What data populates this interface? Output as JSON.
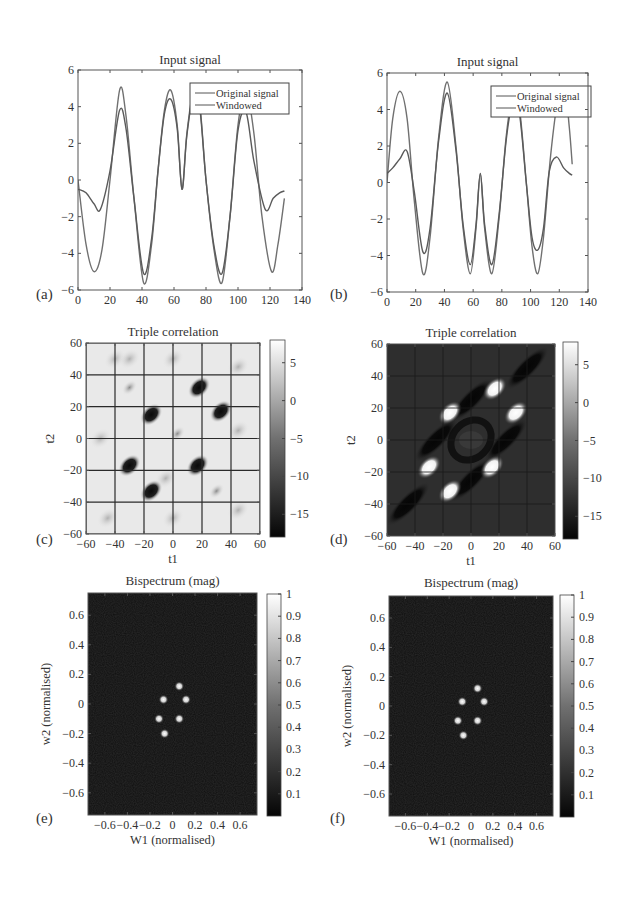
{
  "figure": {
    "panels": [
      "(a)",
      "(b)",
      "(c)",
      "(d)",
      "(e)",
      "(f)"
    ]
  },
  "chart_data": [
    {
      "panel": "(a)",
      "type": "line",
      "title": "Input signal",
      "xlabel": "",
      "ylabel": "",
      "xlim": [
        0,
        140
      ],
      "ylim": [
        -6,
        6
      ],
      "xticks": [
        0,
        20,
        40,
        60,
        80,
        100,
        120,
        140
      ],
      "yticks": [
        -6,
        -4,
        -2,
        0,
        2,
        4,
        6
      ],
      "legend": [
        "Original signal",
        "Windowed"
      ],
      "legend_position": "upper right",
      "series": [
        {
          "name": "Original signal",
          "x": [
            0,
            5,
            10,
            15,
            20,
            26,
            30,
            35,
            41,
            46,
            50,
            54,
            58,
            62,
            65,
            68,
            72,
            76,
            80,
            85,
            90,
            95,
            100,
            105,
            110,
            115,
            121,
            125,
            129
          ],
          "y": [
            0,
            -3.5,
            -5,
            -3.8,
            0,
            4.9,
            3.5,
            -1,
            -5.6,
            -3.5,
            0.5,
            3.8,
            4.9,
            3,
            -0.5,
            2.5,
            4.8,
            4.2,
            0,
            -3.8,
            -5.6,
            -2,
            3,
            4.9,
            2.5,
            -2,
            -5,
            -3.5,
            -1
          ]
        },
        {
          "name": "Windowed",
          "x": [
            0,
            5,
            10,
            14,
            20,
            26,
            30,
            35,
            41,
            46,
            50,
            54,
            58,
            62,
            65,
            68,
            72,
            76,
            80,
            85,
            90,
            95,
            100,
            105,
            110,
            117,
            122,
            126,
            129
          ],
          "y": [
            -0.5,
            -0.7,
            -1.3,
            -1.6,
            0.5,
            3.8,
            2.8,
            -1,
            -5.1,
            -3.2,
            0.5,
            3.6,
            4.4,
            2.8,
            -0.5,
            2.4,
            4.6,
            4,
            0,
            -3.6,
            -5.1,
            -2,
            2.7,
            3.7,
            1,
            -1.6,
            -1,
            -0.7,
            -0.6
          ]
        }
      ]
    },
    {
      "panel": "(b)",
      "type": "line",
      "title": "Input signal",
      "xlabel": "",
      "ylabel": "",
      "xlim": [
        0,
        140
      ],
      "ylim": [
        -6,
        6
      ],
      "xticks": [
        0,
        20,
        40,
        60,
        80,
        100,
        120,
        140
      ],
      "yticks": [
        -6,
        -4,
        -2,
        0,
        2,
        4,
        6
      ],
      "legend": [
        "Original signal",
        "Windowed"
      ],
      "legend_position": "upper right",
      "series": [
        {
          "name": "Original signal",
          "x": [
            0,
            4,
            9,
            14,
            19,
            25,
            30,
            36,
            42,
            48,
            53,
            58,
            62,
            65,
            68,
            73,
            78,
            83,
            87,
            92,
            97,
            101,
            105,
            109,
            114,
            119,
            124,
            127,
            129
          ],
          "y": [
            0,
            3.5,
            5,
            3.5,
            -1,
            -5,
            -3,
            2.5,
            5.5,
            2,
            -2.5,
            -5,
            -2.5,
            0.5,
            -2.5,
            -5,
            -2,
            2.5,
            4.5,
            4.2,
            0,
            -3.5,
            -5,
            -3,
            1.5,
            4.5,
            5,
            3,
            1
          ]
        },
        {
          "name": "Windowed",
          "x": [
            0,
            4,
            9,
            14,
            19,
            25,
            30,
            36,
            42,
            48,
            53,
            58,
            62,
            65,
            68,
            73,
            78,
            83,
            87,
            92,
            97,
            101,
            105,
            109,
            113,
            118,
            123,
            127,
            129
          ],
          "y": [
            0.5,
            0.8,
            1.3,
            1.7,
            -0.5,
            -3.8,
            -2.5,
            2.3,
            4.9,
            1.8,
            -2.3,
            -4.5,
            -2.3,
            0.5,
            -2.3,
            -4.5,
            -1.8,
            2.3,
            4.2,
            3.9,
            0,
            -3,
            -3.7,
            -2.5,
            0.6,
            1.4,
            0.8,
            0.5,
            0.4
          ]
        }
      ]
    },
    {
      "panel": "(c)",
      "type": "heatmap",
      "title": "Triple correlation",
      "xlabel": "t1",
      "ylabel": "t2",
      "xlim": [
        -60,
        60
      ],
      "ylim": [
        -60,
        60
      ],
      "xticks": [
        -60,
        -40,
        -20,
        0,
        20,
        40,
        60
      ],
      "yticks": [
        -60,
        -40,
        -20,
        0,
        20,
        40,
        60
      ],
      "grid": true,
      "background": "light",
      "colorbar": {
        "ticks": [
          5,
          0,
          -5,
          -10,
          -15
        ],
        "range": [
          -18,
          8
        ]
      },
      "dark_blobs": [
        {
          "t1": 18,
          "t2": 32,
          "v": -16
        },
        {
          "t1": 33,
          "t2": 17,
          "v": -16
        },
        {
          "t1": -15,
          "t2": 15,
          "v": -16
        },
        {
          "t1": -30,
          "t2": -17,
          "v": -16
        },
        {
          "t1": 17,
          "t2": -17,
          "v": -15
        },
        {
          "t1": -15,
          "t2": -33,
          "v": -16
        },
        {
          "t1": -30,
          "t2": 32,
          "v": -8
        },
        {
          "t1": 30,
          "t2": -33,
          "v": -8
        },
        {
          "t1": 3,
          "t2": 3,
          "v": -5
        }
      ]
    },
    {
      "panel": "(d)",
      "type": "heatmap",
      "title": "Triple correlation",
      "xlabel": "t1",
      "ylabel": "t2",
      "xlim": [
        -60,
        60
      ],
      "ylim": [
        -60,
        60
      ],
      "xticks": [
        -60,
        -40,
        -20,
        0,
        20,
        40,
        60
      ],
      "yticks": [
        -60,
        -40,
        -20,
        0,
        20,
        40,
        60
      ],
      "grid": true,
      "background": "dark",
      "colorbar": {
        "ticks": [
          5,
          0,
          -5,
          -10,
          -15
        ],
        "range": [
          -18,
          8
        ]
      },
      "bright_blobs": [
        {
          "t1": 17,
          "t2": 32,
          "v": 7
        },
        {
          "t1": 32,
          "t2": 17,
          "v": 7
        },
        {
          "t1": -15,
          "t2": 17,
          "v": 7
        },
        {
          "t1": -30,
          "t2": -17,
          "v": 7
        },
        {
          "t1": 15,
          "t2": -17,
          "v": 7
        },
        {
          "t1": -15,
          "t2": -32,
          "v": 7
        },
        {
          "t1": 0,
          "t2": 0,
          "v": -8
        }
      ]
    },
    {
      "panel": "(e)",
      "type": "heatmap",
      "title": "Bispectrum (mag)",
      "xlabel": "W1 (normalised)",
      "ylabel": "w2 (normalised)",
      "xlim": [
        -0.75,
        0.75
      ],
      "ylim": [
        -0.75,
        0.75
      ],
      "xticks": [
        -0.6,
        -0.4,
        -0.2,
        0,
        0.2,
        0.4,
        0.6
      ],
      "yticks": [
        0.6,
        0.4,
        0.2,
        0,
        -0.2,
        -0.4,
        -0.6
      ],
      "colorbar": {
        "ticks": [
          1,
          0.9,
          0.8,
          0.7,
          0.6,
          0.5,
          0.4,
          0.3,
          0.2,
          0.1
        ],
        "range": [
          0,
          1
        ]
      },
      "peaks": [
        {
          "w1": 0.06,
          "w2": 0.12,
          "v": 1
        },
        {
          "w1": -0.08,
          "w2": 0.03,
          "v": 1
        },
        {
          "w1": 0.12,
          "w2": 0.03,
          "v": 1
        },
        {
          "w1": -0.12,
          "w2": -0.1,
          "v": 1
        },
        {
          "w1": 0.06,
          "w2": -0.1,
          "v": 1
        },
        {
          "w1": -0.07,
          "w2": -0.2,
          "v": 1
        }
      ]
    },
    {
      "panel": "(f)",
      "type": "heatmap",
      "title": "Bispectrum (mag)",
      "xlabel": "W1 (normalised)",
      "ylabel": "w2 (normalised)",
      "xlim": [
        -0.75,
        0.75
      ],
      "ylim": [
        -0.75,
        0.75
      ],
      "xticks": [
        -0.6,
        -0.4,
        -0.2,
        0,
        0.2,
        0.4,
        0.6
      ],
      "yticks": [
        0.6,
        0.4,
        0.2,
        0,
        -0.2,
        -0.4,
        -0.6
      ],
      "colorbar": {
        "ticks": [
          1,
          0.9,
          0.8,
          0.7,
          0.6,
          0.5,
          0.4,
          0.3,
          0.2,
          0.1
        ],
        "range": [
          0,
          1
        ]
      },
      "peaks": [
        {
          "w1": 0.06,
          "w2": 0.12,
          "v": 1
        },
        {
          "w1": -0.08,
          "w2": 0.03,
          "v": 1
        },
        {
          "w1": 0.12,
          "w2": 0.03,
          "v": 1
        },
        {
          "w1": -0.12,
          "w2": -0.1,
          "v": 1
        },
        {
          "w1": 0.06,
          "w2": -0.1,
          "v": 1
        },
        {
          "w1": -0.07,
          "w2": -0.2,
          "v": 1
        }
      ]
    }
  ],
  "layout": {
    "boxes": [
      {
        "x": 78,
        "y": 70,
        "w": 224,
        "h": 220,
        "label_x": 36,
        "label_y": 299,
        "title_y": 64
      },
      {
        "x": 387,
        "y": 73,
        "w": 201,
        "h": 219,
        "label_x": 330,
        "label_y": 299,
        "title_y": 66
      },
      {
        "x": 86,
        "y": 343,
        "w": 174,
        "h": 191,
        "cb_x": 270,
        "cb_w": 15,
        "cb_y": 340,
        "cb_h": 197,
        "label_x": 36,
        "label_y": 544,
        "title_y": 336
      },
      {
        "x": 387,
        "y": 344,
        "w": 168,
        "h": 192,
        "cb_x": 563,
        "cb_w": 15,
        "cb_y": 342,
        "cb_h": 197,
        "label_x": 330,
        "label_y": 544,
        "title_y": 337
      },
      {
        "x": 88,
        "y": 593,
        "w": 169,
        "h": 222,
        "cb_x": 267,
        "cb_w": 14,
        "cb_y": 594,
        "cb_h": 222,
        "label_x": 36,
        "label_y": 823,
        "title_y": 585
      },
      {
        "x": 389,
        "y": 596,
        "w": 164,
        "h": 220,
        "cb_x": 560,
        "cb_w": 14,
        "cb_y": 595,
        "cb_h": 222,
        "label_x": 330,
        "label_y": 823,
        "title_y": 587
      }
    ],
    "colors": {
      "line": "#6a6a6a",
      "axis": "#555555",
      "grid": "#2a2a2a",
      "dark_bg": "#2e2e2e",
      "light_bg": "#e9e9e9",
      "bispec_bg": "#0e0e0e"
    }
  }
}
